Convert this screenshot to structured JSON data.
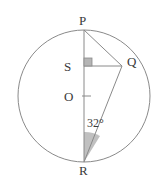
{
  "figure": {
    "type": "circle-geometry-diagram",
    "background_color": "#ffffff",
    "stroke_color": "#8a8a8a",
    "label_color": "#3a3a3a",
    "shade_fill": "#b5b5b5",
    "right_angle_fill": "#b5b5b5",
    "circle": {
      "center_label": "O",
      "cx": 84,
      "cy": 96,
      "r": 66
    },
    "points": [
      {
        "name": "P",
        "label": "P",
        "x": 84,
        "y": 30,
        "on_circle": true
      },
      {
        "name": "Q",
        "label": "Q",
        "x": 122,
        "y": 66,
        "on_circle": true
      },
      {
        "name": "S",
        "label": "S",
        "x": 84,
        "y": 66,
        "on_circle": false
      },
      {
        "name": "O",
        "label": "O",
        "x": 84,
        "y": 96,
        "on_circle": false
      },
      {
        "name": "R",
        "label": "R",
        "x": 84,
        "y": 162,
        "on_circle": true
      }
    ],
    "segments": [
      {
        "name": "PR",
        "from": "P",
        "to": "R",
        "note": "vertical diameter"
      },
      {
        "name": "PQ",
        "from": "P",
        "to": "Q",
        "note": "chord"
      },
      {
        "name": "SQ",
        "from": "S",
        "to": "Q",
        "note": "perpendicular to PR"
      },
      {
        "name": "RQ",
        "from": "R",
        "to": "Q",
        "note": "chord"
      }
    ],
    "angles": [
      {
        "name": "angle-at-S",
        "vertex": "S",
        "value": "",
        "marker": "right-angle-square",
        "filled": true
      },
      {
        "name": "angle-at-R",
        "vertex": "R",
        "value": "32",
        "unit": "°",
        "label": "32°",
        "marker": "shaded-wedge",
        "between": [
          "RP",
          "RQ"
        ]
      }
    ],
    "center_tick": {
      "name": "centre-tick-mark",
      "x1": 82,
      "y1": 96,
      "x2": 90,
      "y2": 96
    }
  }
}
